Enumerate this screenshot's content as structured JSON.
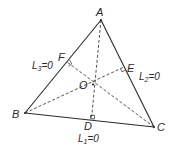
{
  "diagram": {
    "type": "geometry",
    "colors": {
      "stroke": "#2a2a2a",
      "background": "#ffffff"
    },
    "vertices": {
      "A": {
        "label": "A",
        "x": 101,
        "y": 20
      },
      "B": {
        "label": "B",
        "x": 25,
        "y": 113
      },
      "C": {
        "label": "C",
        "x": 154,
        "y": 127
      }
    },
    "feet": {
      "D": {
        "label": "D",
        "on": "BC"
      },
      "E": {
        "label": "E",
        "on": "CA"
      },
      "F": {
        "label": "F",
        "on": "AB"
      }
    },
    "orthocenter": {
      "label": "O"
    },
    "line_labels": {
      "L1": {
        "name": "L",
        "sub": "1",
        "rest": "=0",
        "side": "BC"
      },
      "L2": {
        "name": "L",
        "sub": "2",
        "rest": "=0",
        "side": "CA"
      },
      "L3": {
        "name": "L",
        "sub": "3",
        "rest": "=0",
        "side": "AB"
      }
    }
  }
}
